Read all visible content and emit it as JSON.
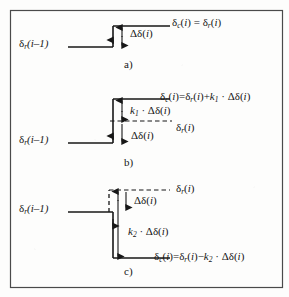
{
  "figure": {
    "border_color": "#4a4a4a",
    "line_color": "#171717",
    "background": "#fdfdfc",
    "panels": [
      {
        "id": "a",
        "letter": "a)",
        "left_label": "δr(i−1)",
        "left_label_parts": {
          "symbol": "δ",
          "sub": "r",
          "arg": "(i–1)"
        },
        "delta_label": "Δδ(i)",
        "equation": "δc(i) = δr(i)",
        "equation_parts": {
          "lhs_symbol": "δ",
          "lhs_sub": "c",
          "lhs_arg": "(i)",
          "relation": "=",
          "rhs": "δr(i)"
        },
        "step_direction": "up",
        "description": "Step up by one delta; corrected equals reference."
      },
      {
        "id": "b",
        "letter": "b)",
        "left_label": "δr(i−1)",
        "upper_arrow_label": "k1·Δδ(i)",
        "dashed_level_label": "δr(i)",
        "lower_arrow_label": "Δδ(i)",
        "equation": "δc(i)=δr(i)+k1·Δδ(i)",
        "step_direction": "up",
        "description": "Overshoot above reference by k1 times delta."
      },
      {
        "id": "c",
        "letter": "c)",
        "left_label": "δr(i−1)",
        "dashed_level_label": "δr(i)",
        "upper_arrow_label": "Δδ(i)",
        "lower_arrow_label": "k2·Δδ(i)",
        "equation": "δc(i)=δr(i)−k2·Δδ(i)",
        "step_direction": "down",
        "description": "Undershoot below reference by k2 times delta."
      }
    ],
    "symbols": {
      "delta_lower": "δ",
      "delta_upper": "Δ",
      "minus": "−",
      "dot_operator": "·",
      "sub_r": "r",
      "sub_c": "c",
      "sub_1": "1",
      "sub_2": "2",
      "index": "i"
    }
  }
}
